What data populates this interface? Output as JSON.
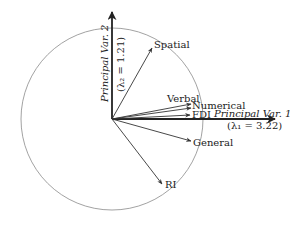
{
  "diagram": {
    "type": "biplot-unit-circle",
    "colors": {
      "stroke": "#333333",
      "circle": "#8a8a8a",
      "text": "#222222"
    },
    "axes": {
      "x": {
        "label": "Principal Var. 1",
        "eigen": "(λ₁ = 3.22)"
      },
      "y": {
        "label": "Principal Var. 2",
        "eigen": "(λ₂ = 1.21)"
      }
    },
    "vectors": [
      {
        "name": "Spatial"
      },
      {
        "name": "Verbal"
      },
      {
        "name": "Numerical"
      },
      {
        "name": "FDI"
      },
      {
        "name": "General"
      },
      {
        "name": "RI"
      }
    ]
  }
}
